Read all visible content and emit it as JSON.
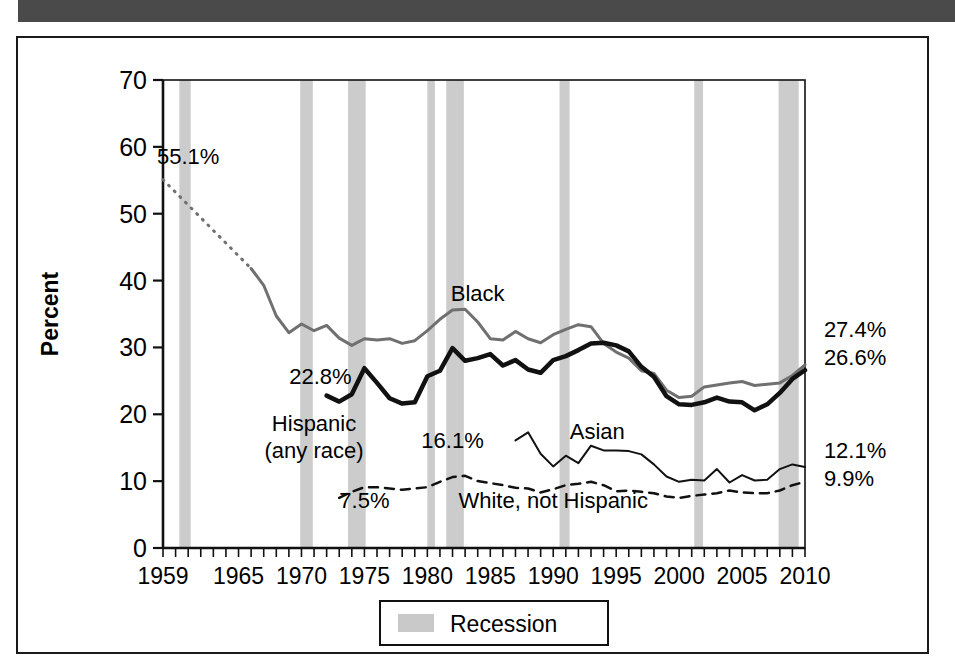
{
  "page": {
    "top_bar_color": "#4a4a4a",
    "frame_border_color": "#1a1a1a",
    "background": "#ffffff"
  },
  "chart_data": {
    "type": "line",
    "title": "",
    "xlabel": "",
    "ylabel": "Percent",
    "xlim": [
      1959,
      2010
    ],
    "ylim": [
      0,
      70
    ],
    "yticks": [
      0,
      10,
      20,
      30,
      40,
      50,
      60,
      70
    ],
    "xticks": [
      1959,
      1965,
      1970,
      1975,
      1980,
      1985,
      1990,
      1995,
      2000,
      2005,
      2010
    ],
    "grid": false,
    "legend_position": "bottom-center",
    "legend": [
      {
        "label": "Recession",
        "color": "#c9c9c9",
        "type": "band"
      }
    ],
    "annotations": [
      {
        "text": "55.1%",
        "x": 1961.0,
        "y": 57.5,
        "series": "Black"
      },
      {
        "text": "22.8%",
        "x": 1971.5,
        "y": 24.5,
        "series": "Hispanic (any race)"
      },
      {
        "text": "Black",
        "x": 1984.0,
        "y": 37.0,
        "series": "Black"
      },
      {
        "text": "Hispanic\n(any race)",
        "x": 1971.0,
        "y": 17.5,
        "series": "Hispanic (any race)"
      },
      {
        "text": "16.1%",
        "x": 1982.0,
        "y": 15.0,
        "series": "Asian"
      },
      {
        "text": "Asian",
        "x": 1993.5,
        "y": 16.3,
        "series": "Asian"
      },
      {
        "text": "7.5%",
        "x": 1975.0,
        "y": 6.0,
        "series": "White, not Hispanic"
      },
      {
        "text": "White, not Hispanic",
        "x": 1990.0,
        "y": 6.0,
        "series": "White, not Hispanic"
      },
      {
        "text": "27.4%",
        "x": 2011.5,
        "y": 31.5,
        "series": "Black"
      },
      {
        "text": "26.6%",
        "x": 2011.5,
        "y": 27.3,
        "series": "Hispanic (any race)"
      },
      {
        "text": "12.1%",
        "x": 2011.5,
        "y": 13.4,
        "series": "Asian"
      },
      {
        "text": "9.9%",
        "x": 2011.5,
        "y": 9.3,
        "series": "White, not Hispanic"
      }
    ],
    "recession_bands": [
      {
        "start": 1960.3,
        "end": 1961.2
      },
      {
        "start": 1969.9,
        "end": 1970.9
      },
      {
        "start": 1973.7,
        "end": 1975.1
      },
      {
        "start": 1980.0,
        "end": 1980.6
      },
      {
        "start": 1981.5,
        "end": 1982.9
      },
      {
        "start": 1990.5,
        "end": 1991.3
      },
      {
        "start": 2001.2,
        "end": 2001.9
      },
      {
        "start": 2007.9,
        "end": 2009.5
      }
    ],
    "series": [
      {
        "name": "Black",
        "color": "#707070",
        "style": "solid",
        "width": 3,
        "lead_style": "dotted",
        "lead_x": [
          1959,
          1966
        ],
        "lead_y": [
          55.1,
          41.8
        ],
        "x": [
          1966,
          1967,
          1968,
          1969,
          1970,
          1971,
          1972,
          1973,
          1974,
          1975,
          1976,
          1977,
          1978,
          1979,
          1980,
          1981,
          1982,
          1983,
          1984,
          1985,
          1986,
          1987,
          1988,
          1989,
          1990,
          1991,
          1992,
          1993,
          1994,
          1995,
          1996,
          1997,
          1998,
          1999,
          2000,
          2001,
          2002,
          2003,
          2004,
          2005,
          2006,
          2007,
          2008,
          2009,
          2010
        ],
        "y": [
          41.8,
          39.3,
          34.7,
          32.2,
          33.5,
          32.5,
          33.3,
          31.4,
          30.3,
          31.3,
          31.1,
          31.3,
          30.6,
          31.0,
          32.5,
          34.2,
          35.6,
          35.7,
          33.8,
          31.3,
          31.1,
          32.4,
          31.3,
          30.7,
          31.9,
          32.7,
          33.4,
          33.1,
          30.6,
          29.3,
          28.4,
          26.5,
          26.1,
          23.6,
          22.5,
          22.7,
          24.1,
          24.4,
          24.7,
          24.9,
          24.3,
          24.5,
          24.7,
          25.8,
          27.4
        ]
      },
      {
        "name": "Hispanic (any race)",
        "color": "#111111",
        "style": "solid",
        "width": 4.5,
        "x": [
          1972,
          1973,
          1974,
          1975,
          1976,
          1977,
          1978,
          1979,
          1980,
          1981,
          1982,
          1983,
          1984,
          1985,
          1986,
          1987,
          1988,
          1989,
          1990,
          1991,
          1992,
          1993,
          1994,
          1995,
          1996,
          1997,
          1998,
          1999,
          2000,
          2001,
          2002,
          2003,
          2004,
          2005,
          2006,
          2007,
          2008,
          2009,
          2010
        ],
        "y": [
          22.8,
          21.9,
          23.0,
          26.9,
          24.7,
          22.4,
          21.6,
          21.8,
          25.7,
          26.5,
          29.9,
          28.0,
          28.4,
          29.0,
          27.3,
          28.1,
          26.7,
          26.2,
          28.1,
          28.7,
          29.6,
          30.6,
          30.7,
          30.3,
          29.4,
          27.1,
          25.6,
          22.7,
          21.5,
          21.4,
          21.8,
          22.5,
          21.9,
          21.8,
          20.6,
          21.5,
          23.2,
          25.3,
          26.6
        ]
      },
      {
        "name": "Asian",
        "color": "#111111",
        "style": "solid",
        "width": 2,
        "x": [
          1987,
          1988,
          1989,
          1990,
          1991,
          1992,
          1993,
          1994,
          1995,
          1996,
          1997,
          1998,
          1999,
          2000,
          2001,
          2002,
          2003,
          2004,
          2005,
          2006,
          2007,
          2008,
          2009,
          2010
        ],
        "y": [
          16.1,
          17.3,
          14.1,
          12.2,
          13.8,
          12.7,
          15.3,
          14.6,
          14.6,
          14.5,
          14.0,
          12.5,
          10.7,
          9.9,
          10.2,
          10.1,
          11.8,
          9.8,
          10.9,
          10.1,
          10.2,
          11.8,
          12.5,
          12.1
        ]
      },
      {
        "name": "White, not Hispanic",
        "color": "#111111",
        "style": "dashed",
        "width": 2.5,
        "x": [
          1973,
          1974,
          1975,
          1976,
          1977,
          1978,
          1979,
          1980,
          1981,
          1982,
          1983,
          1984,
          1985,
          1986,
          1987,
          1988,
          1989,
          1990,
          1991,
          1992,
          1993,
          1994,
          1995,
          1996,
          1997,
          1998,
          1999,
          2000,
          2001,
          2002,
          2003,
          2004,
          2005,
          2006,
          2007,
          2008,
          2009,
          2010
        ],
        "y": [
          7.5,
          8.4,
          9.1,
          9.1,
          8.9,
          8.7,
          8.9,
          9.1,
          9.9,
          10.6,
          10.8,
          10.0,
          9.7,
          9.4,
          9.0,
          8.9,
          8.3,
          8.8,
          9.4,
          9.6,
          9.9,
          9.4,
          8.5,
          8.6,
          8.4,
          8.2,
          7.7,
          7.5,
          7.8,
          8.0,
          8.2,
          8.6,
          8.3,
          8.2,
          8.2,
          8.6,
          9.4,
          9.9
        ]
      }
    ]
  }
}
